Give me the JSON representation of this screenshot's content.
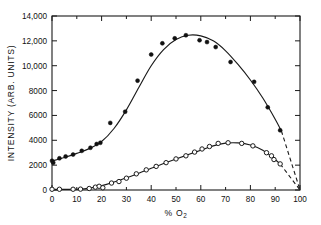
{
  "chart_data": {
    "type": "scatter",
    "title": "",
    "xlabel": "% O2",
    "xlabel_main": "%  O",
    "xlabel_sub": "2",
    "ylabel": "INTENSITY (ARB. UNITS)",
    "xlim": [
      0,
      100
    ],
    "ylim": [
      0,
      14000
    ],
    "grid": false,
    "legend": "none",
    "xticks": [
      0,
      10,
      20,
      30,
      40,
      50,
      60,
      70,
      80,
      90,
      100
    ],
    "xticklabels": [
      "0",
      "10",
      "20",
      "30",
      "40",
      "50",
      "60",
      "70",
      "80",
      "90",
      "100"
    ],
    "yticks": [
      0,
      2000,
      4000,
      6000,
      8000,
      10000,
      12000,
      14000
    ],
    "yticklabels": [
      "0",
      "2000",
      "4000",
      "6000",
      "8000",
      "10,000",
      "12,000",
      "14,000"
    ],
    "tick_direction": "in",
    "frame": "box",
    "series": [
      {
        "name": "filled-circles",
        "marker": "filled circle",
        "color": "#111111",
        "points": [
          {
            "x": 0.0,
            "y": 2350
          },
          {
            "x": 0.5,
            "y": 2200
          },
          {
            "x": 3.0,
            "y": 2550
          },
          {
            "x": 5.5,
            "y": 2700
          },
          {
            "x": 8.5,
            "y": 2850
          },
          {
            "x": 12.0,
            "y": 3150
          },
          {
            "x": 15.5,
            "y": 3400
          },
          {
            "x": 18.0,
            "y": 3700
          },
          {
            "x": 19.5,
            "y": 3800
          },
          {
            "x": 23.5,
            "y": 5400
          },
          {
            "x": 29.5,
            "y": 6300
          },
          {
            "x": 34.5,
            "y": 8800
          },
          {
            "x": 40.0,
            "y": 10900
          },
          {
            "x": 44.5,
            "y": 11800
          },
          {
            "x": 49.5,
            "y": 12200
          },
          {
            "x": 54.0,
            "y": 12450
          },
          {
            "x": 59.5,
            "y": 12050
          },
          {
            "x": 62.5,
            "y": 11900
          },
          {
            "x": 66.0,
            "y": 11500
          },
          {
            "x": 72.0,
            "y": 10300
          },
          {
            "x": 81.5,
            "y": 8700
          },
          {
            "x": 87.0,
            "y": 6650
          },
          {
            "x": 92.0,
            "y": 4800
          }
        ],
        "fit_curve": [
          {
            "x": 0,
            "y": 2330
          },
          {
            "x": 5,
            "y": 2620
          },
          {
            "x": 10,
            "y": 2950
          },
          {
            "x": 15,
            "y": 3330
          },
          {
            "x": 20,
            "y": 3900
          },
          {
            "x": 25,
            "y": 4950
          },
          {
            "x": 30,
            "y": 6450
          },
          {
            "x": 35,
            "y": 8250
          },
          {
            "x": 40,
            "y": 10000
          },
          {
            "x": 45,
            "y": 11300
          },
          {
            "x": 50,
            "y": 12100
          },
          {
            "x": 55,
            "y": 12450
          },
          {
            "x": 60,
            "y": 12400
          },
          {
            "x": 65,
            "y": 12000
          },
          {
            "x": 70,
            "y": 11200
          },
          {
            "x": 75,
            "y": 10100
          },
          {
            "x": 80,
            "y": 8850
          },
          {
            "x": 85,
            "y": 7400
          },
          {
            "x": 90,
            "y": 5700
          },
          {
            "x": 92.5,
            "y": 4750
          }
        ],
        "extrapolation": [
          {
            "x": 92.5,
            "y": 4750
          },
          {
            "x": 100,
            "y": 0
          }
        ]
      },
      {
        "name": "open-circles",
        "marker": "open circle",
        "color": "#1a1a1a",
        "points": [
          {
            "x": 0.0,
            "y": 60
          },
          {
            "x": 3.0,
            "y": 60
          },
          {
            "x": 8.5,
            "y": 60
          },
          {
            "x": 11.5,
            "y": 70
          },
          {
            "x": 15.0,
            "y": 120
          },
          {
            "x": 17.5,
            "y": 230
          },
          {
            "x": 19.0,
            "y": 300
          },
          {
            "x": 20.5,
            "y": 180
          },
          {
            "x": 24.0,
            "y": 560
          },
          {
            "x": 27.0,
            "y": 680
          },
          {
            "x": 30.0,
            "y": 950
          },
          {
            "x": 34.0,
            "y": 1300
          },
          {
            "x": 38.0,
            "y": 1620
          },
          {
            "x": 42.0,
            "y": 1900
          },
          {
            "x": 46.0,
            "y": 2200
          },
          {
            "x": 50.0,
            "y": 2500
          },
          {
            "x": 54.0,
            "y": 2750
          },
          {
            "x": 57.5,
            "y": 3050
          },
          {
            "x": 60.5,
            "y": 3300
          },
          {
            "x": 63.5,
            "y": 3500
          },
          {
            "x": 67.0,
            "y": 3750
          },
          {
            "x": 71.0,
            "y": 3800
          },
          {
            "x": 76.5,
            "y": 3750
          },
          {
            "x": 81.0,
            "y": 3550
          },
          {
            "x": 86.5,
            "y": 3000
          },
          {
            "x": 88.5,
            "y": 2750
          },
          {
            "x": 89.5,
            "y": 2450
          },
          {
            "x": 92.0,
            "y": 2100
          }
        ],
        "fit_curve": [
          {
            "x": 0,
            "y": 55
          },
          {
            "x": 8,
            "y": 55
          },
          {
            "x": 13,
            "y": 90
          },
          {
            "x": 18,
            "y": 250
          },
          {
            "x": 22,
            "y": 450
          },
          {
            "x": 26,
            "y": 700
          },
          {
            "x": 30,
            "y": 980
          },
          {
            "x": 35,
            "y": 1350
          },
          {
            "x": 40,
            "y": 1750
          },
          {
            "x": 45,
            "y": 2130
          },
          {
            "x": 50,
            "y": 2500
          },
          {
            "x": 55,
            "y": 2850
          },
          {
            "x": 60,
            "y": 3200
          },
          {
            "x": 65,
            "y": 3550
          },
          {
            "x": 70,
            "y": 3770
          },
          {
            "x": 75,
            "y": 3790
          },
          {
            "x": 80,
            "y": 3620
          },
          {
            "x": 85,
            "y": 3200
          },
          {
            "x": 89,
            "y": 2620
          },
          {
            "x": 92,
            "y": 2100
          }
        ],
        "extrapolation": [
          {
            "x": 92,
            "y": 2100
          },
          {
            "x": 100,
            "y": 0
          }
        ]
      }
    ]
  }
}
